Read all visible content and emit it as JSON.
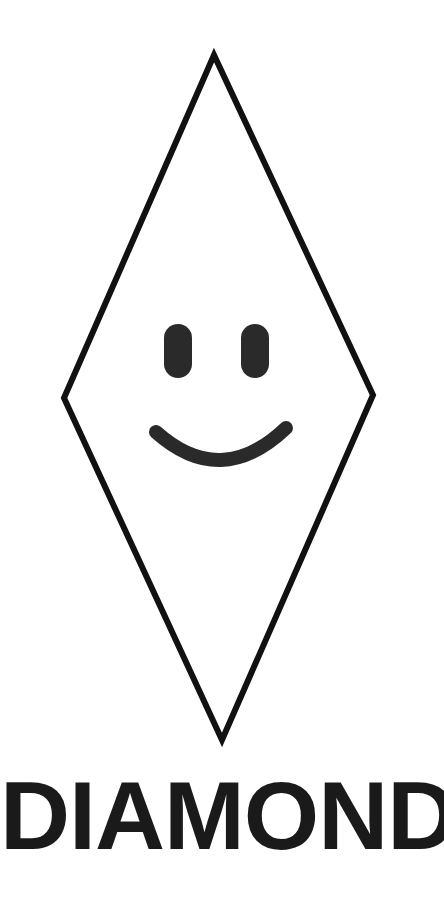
{
  "illustration": {
    "shape_name": "diamond",
    "label": "DIAMOND",
    "colors": {
      "background": "#ffffff",
      "outline": "#111111",
      "face": "#2a2a2a",
      "text": "#1a1a1a"
    },
    "outline": {
      "stroke_width": 6,
      "vertices": {
        "top": [
          214,
          55
        ],
        "right": [
          373,
          395
        ],
        "bottom": [
          222,
          740
        ],
        "left": [
          64,
          398
        ]
      }
    },
    "face": {
      "expression": "smile",
      "left_eye": {
        "x": 164,
        "y": 324,
        "width": 28,
        "height": 54
      },
      "right_eye": {
        "x": 241,
        "y": 324,
        "width": 28,
        "height": 54
      },
      "mouth": {
        "start": [
          156,
          432
        ],
        "control": [
          221,
          490
        ],
        "end": [
          286,
          428
        ],
        "stroke_width": 14
      }
    }
  }
}
